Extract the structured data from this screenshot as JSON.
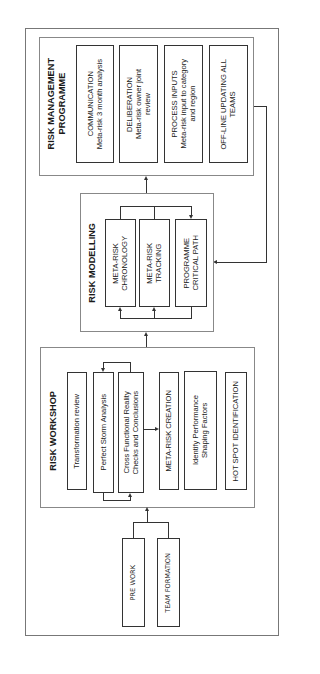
{
  "risk_management_programme": {
    "title": "RISK MANAGEMENT PROGRAMME",
    "title_line1": "RISK MANAGEMENT",
    "title_line2": "PROGRAMME",
    "items": [
      {
        "line1": "COMMUNICATION",
        "line2": "Meta-risk 3 month analysis"
      },
      {
        "line1": "DELIBERATION",
        "line2": "Meta-risk owner joint",
        "line3": "review"
      },
      {
        "line1": "PROCESS INPUTS",
        "line2": "Meta-risk input to category",
        "line3": "and region"
      },
      {
        "line1": "OFF-LINE UPDATING ALL",
        "line2": "TEAMS"
      }
    ]
  },
  "risk_modelling": {
    "title": "RISK MODELLING",
    "items": [
      {
        "line1": "META-RISK",
        "line2": "CHRONOLOGY"
      },
      {
        "line1": "META-RISK",
        "line2": "TRACKING"
      },
      {
        "line1": "PROGRAMME",
        "line2": "CRITICAL PATH"
      }
    ]
  },
  "risk_workshop": {
    "title": "RISK WORKSHOP",
    "items": [
      {
        "line1": "Transformation review"
      },
      {
        "line1": "Perfect Storm Analysis"
      },
      {
        "line1": "Cross Functional Reality",
        "line2": "Checks and Conclusions"
      },
      {
        "line1": "META-RISK CREATION"
      },
      {
        "line1": "Identify Performance",
        "line2": "Shaping Factors"
      },
      {
        "line1": "HOT SPOT IDENTIFICATION"
      }
    ]
  },
  "inputs": {
    "items": [
      {
        "label": "PRE WORK"
      },
      {
        "label": "TEAM FORMATION"
      }
    ]
  }
}
